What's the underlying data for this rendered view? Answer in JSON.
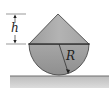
{
  "figure": {
    "type": "cone-on-hemisphere",
    "labels": {
      "height": "h",
      "radius": "R"
    },
    "colors": {
      "solid_fill": "#a9a9a9",
      "hemisphere_fill": "#a0a0a0",
      "outline": "#3a3a3a",
      "ground_fill": "#c8c8c8",
      "ground_top": "#6e6e6e",
      "dimension_line": "#333333"
    }
  }
}
